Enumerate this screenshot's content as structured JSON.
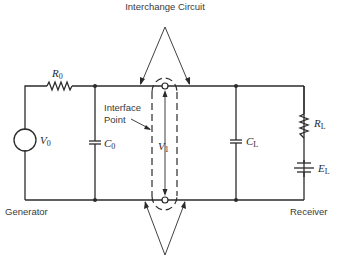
{
  "diagram": {
    "title": "Interchange Circuit",
    "labels": {
      "interface_line1": "Interface",
      "interface_line2": "Point",
      "generator": "Generator",
      "receiver": "Receiver"
    },
    "components": {
      "R0": {
        "main": "R",
        "sub": "0"
      },
      "C0": {
        "main": "C",
        "sub": "0"
      },
      "V0": {
        "main": "V",
        "sub": "0"
      },
      "V1": {
        "main": "V",
        "sub": "1"
      },
      "CL": {
        "main": "C",
        "sub": "L"
      },
      "RL": {
        "main": "R",
        "sub": "L"
      },
      "EL": {
        "main": "E",
        "sub": "L"
      }
    },
    "colors": {
      "ink": "#2b2b2b",
      "background": "#ffffff"
    }
  }
}
